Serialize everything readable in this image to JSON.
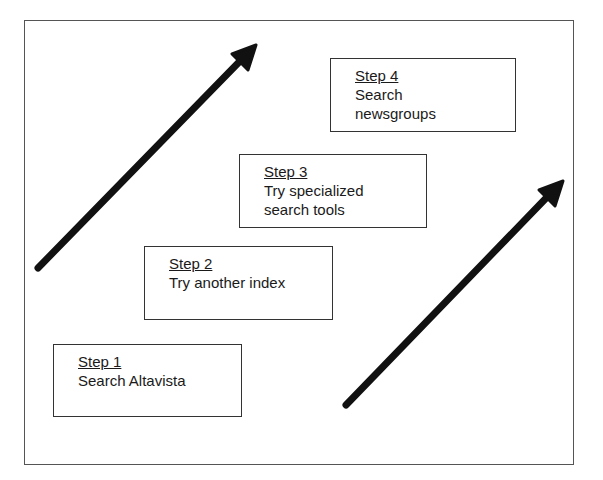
{
  "diagram": {
    "steps": [
      {
        "title": "Step 1",
        "lines": [
          "Search Altavista"
        ]
      },
      {
        "title": "Step 2",
        "lines": [
          "Try another index"
        ]
      },
      {
        "title": "Step 3",
        "lines": [
          "Try specialized",
          "search tools"
        ]
      },
      {
        "title": "Step 4",
        "lines": [
          "Search",
          "newsgroups"
        ]
      }
    ],
    "arrows": [
      {
        "name": "left-arrow",
        "from": [
          38,
          268
        ],
        "to": [
          256,
          45
        ]
      },
      {
        "name": "right-arrow",
        "from": [
          346,
          405
        ],
        "to": [
          563,
          181
        ]
      }
    ],
    "colors": {
      "border": "#333333",
      "arrow": "#111111",
      "background": "#ffffff"
    }
  }
}
